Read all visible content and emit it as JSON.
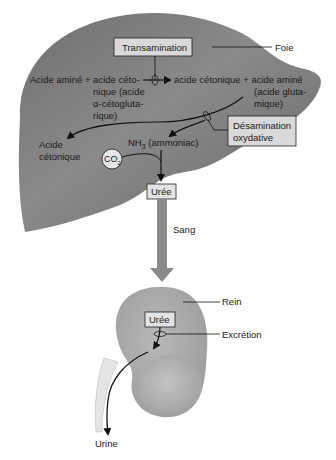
{
  "diagram": {
    "colors": {
      "liver": "#7d7d7d",
      "liver_light": "#9a9a9a",
      "kidney": "#a8a8a8",
      "box_fill": "#d9d9d9",
      "arrow_blood": "#8a8a8a",
      "ureter": "#e6e6e6",
      "line": "#111111"
    },
    "organs": {
      "liver_label": "Foie",
      "kidney_label": "Rein"
    },
    "boxes": {
      "transamination": "Transamination",
      "desamination_line1": "Désamination",
      "desamination_line2": "oxydative",
      "uree_liver": "Urée",
      "uree_kidney": "Urée",
      "co2_main": "CO",
      "co2_sub": "2"
    },
    "reaction": {
      "left_line1": "Acide aminé + acide céto-",
      "left_line2": "nique (acide",
      "left_line3": "α-cétogluta-",
      "left_line4": "rique)",
      "right_line1": "acide cétonique + acide aminé",
      "right_line2": "(acide gluta-",
      "right_line3": "mique)"
    },
    "products": {
      "acide_cetonique_line1": "Acide",
      "acide_cetonique_line2": "cétonique",
      "nh3_main": "NH",
      "nh3_sub": "3",
      "nh3_desc": " (ammoniac)"
    },
    "transport": {
      "blood_label": "Sang"
    },
    "kidney": {
      "excretion_label": "Excrétion",
      "urine_label": "Urine"
    }
  }
}
